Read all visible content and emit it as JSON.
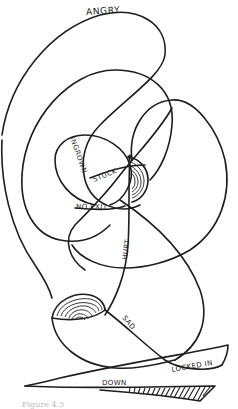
{
  "figure": {
    "type": "hand-drawn emotional path scribble",
    "ink_color": "#1e1e1e",
    "background": "#ffffff",
    "labels": {
      "angry": "ANGRY",
      "ingrown": "INGROWN",
      "stuck": "STUCK",
      "no_exit": "NO EXIT",
      "hurt": "HURT",
      "sad": "SAD",
      "locked_in": "LOCKED IN",
      "down": "DOWN"
    },
    "caption": "Figure 4.3"
  }
}
